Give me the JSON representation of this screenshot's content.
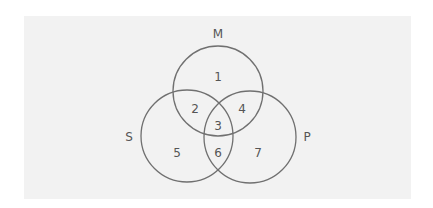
{
  "diagram": {
    "type": "venn-3",
    "colors": {
      "page_background": "#ffffff",
      "panel_background": "#f2f2f2",
      "stroke": "#707070",
      "text": "#555555"
    },
    "sets": [
      {
        "id": "M",
        "label": "M",
        "cx": 218,
        "cy": 91,
        "r": 45,
        "label_x": 218,
        "label_y": 34
      },
      {
        "id": "S",
        "label": "S",
        "cx": 187,
        "cy": 136,
        "r": 46,
        "label_x": 129,
        "label_y": 137
      },
      {
        "id": "P",
        "label": "P",
        "cx": 250,
        "cy": 137,
        "r": 46,
        "label_x": 307,
        "label_y": 137
      }
    ],
    "regions": [
      {
        "label": "1",
        "sets": [
          "M"
        ],
        "x": 218,
        "y": 77
      },
      {
        "label": "2",
        "sets": [
          "M",
          "S"
        ],
        "x": 195,
        "y": 109
      },
      {
        "label": "3",
        "sets": [
          "M",
          "S",
          "P"
        ],
        "x": 218,
        "y": 126
      },
      {
        "label": "4",
        "sets": [
          "M",
          "P"
        ],
        "x": 242,
        "y": 109
      },
      {
        "label": "5",
        "sets": [
          "S"
        ],
        "x": 177,
        "y": 153
      },
      {
        "label": "6",
        "sets": [
          "S",
          "P"
        ],
        "x": 218,
        "y": 153
      },
      {
        "label": "7",
        "sets": [
          "P"
        ],
        "x": 258,
        "y": 153
      }
    ]
  }
}
